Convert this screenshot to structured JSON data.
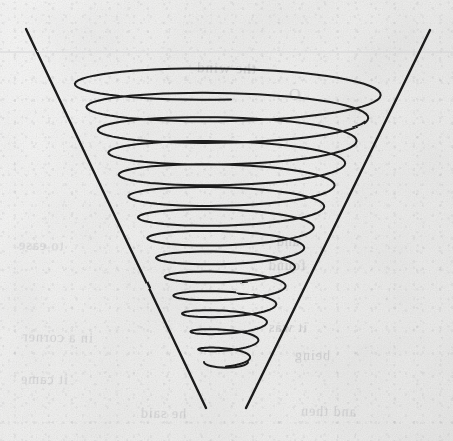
{
  "page": {
    "medium": "ink on lightly textured off-white paper",
    "width": 453,
    "height": 441,
    "background_color": "#f1f1f0",
    "ink_color": "#1a1a1a",
    "ruled_line_color": "#c9c9cd",
    "ghost_text_color": "#8c8c91"
  },
  "figure": {
    "name": "conical-spiral",
    "description": "A helix of constant angular pitch wound on the surface of a downward-pointing cone, drawn with two straight envelope lines forming the cone's silhouette.",
    "apex": {
      "x": 226,
      "y": 412
    },
    "mouth": {
      "cx": 231,
      "cy": 78,
      "rx": 159,
      "ry": 21
    },
    "turns": 14,
    "ellipse_axis_ratio": 0.135,
    "stroke_width": 2.0
  },
  "envelope_lines": [
    {
      "name": "left-envelope-line",
      "x1": 26,
      "y1": 29,
      "x2": 206,
      "y2": 408
    },
    {
      "name": "right-envelope-line",
      "x1": 430,
      "y1": 30,
      "x2": 246,
      "y2": 408
    }
  ],
  "spiral_turns": [
    {
      "index": 1,
      "cy": 78,
      "rx": 159,
      "ry": 21.5
    },
    {
      "index": 2,
      "cy": 101,
      "rx": 147,
      "ry": 20.0
    },
    {
      "index": 3,
      "cy": 124,
      "rx": 135,
      "ry": 18.6
    },
    {
      "index": 4,
      "cy": 147,
      "rx": 124,
      "ry": 17.2
    },
    {
      "index": 5,
      "cy": 169,
      "rx": 113,
      "ry": 15.9
    },
    {
      "index": 6,
      "cy": 191,
      "rx": 103,
      "ry": 14.6
    },
    {
      "index": 7,
      "cy": 212,
      "rx": 93,
      "ry": 13.4
    },
    {
      "index": 8,
      "cy": 233,
      "rx": 83,
      "ry": 12.2
    },
    {
      "index": 9,
      "cy": 253,
      "rx": 74,
      "ry": 11.0
    },
    {
      "index": 10,
      "cy": 272,
      "rx": 65,
      "ry": 9.9
    },
    {
      "index": 11,
      "cy": 291,
      "rx": 56,
      "ry": 8.8
    },
    {
      "index": 12,
      "cy": 309,
      "rx": 47,
      "ry": 7.7
    },
    {
      "index": 13,
      "cy": 327,
      "rx": 38,
      "ry": 6.6
    },
    {
      "index": 14,
      "cy": 345,
      "rx": 30,
      "ry": 5.6
    },
    {
      "index": 15,
      "cy": 362,
      "rx": 22,
      "ry": 4.6
    }
  ],
  "ruled_lines": [
    {
      "name": "faint-ruled-line-top",
      "y": 52,
      "x1": 0,
      "x2": 453
    }
  ],
  "ghost_text_blocks": [
    {
      "id": "g1",
      "x": 196,
      "y": 60,
      "size": 15,
      "rotate": -1.5,
      "text": "the wind"
    },
    {
      "id": "g2",
      "x": 288,
      "y": 86,
      "size": 16,
      "rotate": -1.0,
      "text": "O"
    },
    {
      "id": "g3",
      "x": 18,
      "y": 238,
      "size": 14,
      "rotate": -1.5,
      "text": "to ease"
    },
    {
      "id": "g4",
      "x": 276,
      "y": 234,
      "size": 14,
      "rotate": -1.0,
      "text": "and"
    },
    {
      "id": "g5",
      "x": 268,
      "y": 258,
      "size": 14,
      "rotate": -1.0,
      "text": "found"
    },
    {
      "id": "g6",
      "x": 22,
      "y": 330,
      "size": 14,
      "rotate": -1.2,
      "text": "in a corner"
    },
    {
      "id": "g7",
      "x": 268,
      "y": 320,
      "size": 14,
      "rotate": -0.8,
      "text": "it was"
    },
    {
      "id": "g8",
      "x": 294,
      "y": 348,
      "size": 14,
      "rotate": -0.8,
      "text": "being"
    },
    {
      "id": "g9",
      "x": 20,
      "y": 372,
      "size": 14,
      "rotate": -1.0,
      "text": "it came"
    },
    {
      "id": "g10",
      "x": 140,
      "y": 406,
      "size": 14,
      "rotate": -1.0,
      "text": "he said"
    },
    {
      "id": "g11",
      "x": 300,
      "y": 404,
      "size": 14,
      "rotate": -1.0,
      "text": "and then"
    }
  ]
}
